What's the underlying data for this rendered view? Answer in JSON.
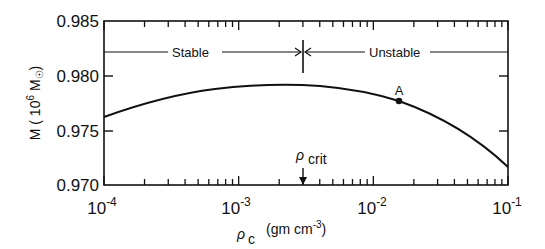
{
  "chart_data": {
    "type": "line",
    "title": "",
    "xlabel": "ρc (gm cm⁻³)",
    "ylabel": "M (10⁶ M⊙)",
    "xscale": "log",
    "xlim": [
      0.0001,
      0.1
    ],
    "ylim": [
      0.97,
      0.985
    ],
    "x_ticks": [
      "10^-4",
      "10^-3",
      "10^-2",
      "10^-1"
    ],
    "y_ticks": [
      "0.970",
      "0.975",
      "0.980",
      "0.985"
    ],
    "grid": false,
    "series": [
      {
        "name": "M vs central density",
        "x": [
          0.0001,
          0.0002,
          0.0005,
          0.001,
          0.002,
          0.003,
          0.005,
          0.01,
          0.0155,
          0.03,
          0.05,
          0.1
        ],
        "y": [
          0.9763,
          0.9772,
          0.9782,
          0.9787,
          0.979,
          0.9791,
          0.9789,
          0.9783,
          0.9777,
          0.9762,
          0.9745,
          0.9716
        ]
      }
    ],
    "annotations": [
      {
        "text": "A",
        "x": 0.0155,
        "y": 0.9777,
        "marker": "filled-circle"
      },
      {
        "text": "ρcrit",
        "x": 0.003,
        "arrow": "down-to-axis"
      },
      {
        "text": "Stable",
        "region": [
          0.0001,
          0.003
        ],
        "y": 0.9822,
        "arrow": "right"
      },
      {
        "text": "Unstable",
        "region": [
          0.003,
          0.1
        ],
        "y": 0.9822,
        "arrow": "left"
      }
    ]
  },
  "labels": {
    "y_axis": "M ( 10",
    "y_axis_exp": "6",
    "y_axis_unit": " M",
    "y_axis_close": ")",
    "x_axis_rho": "ρ",
    "x_axis_sub": "c",
    "x_axis_unit": "(gm cm",
    "x_axis_exp": "-3",
    "x_axis_close": ")",
    "stable": "Stable",
    "unstable": "Unstable",
    "point_a": "A",
    "rho_crit": "ρ",
    "crit_sub": "crit",
    "y_ticks": [
      "0.985",
      "0.980",
      "0.975",
      "0.970"
    ],
    "x_tick_base": "10",
    "x_tick_exps": [
      "-4",
      "-3",
      "-2",
      "-1"
    ]
  }
}
